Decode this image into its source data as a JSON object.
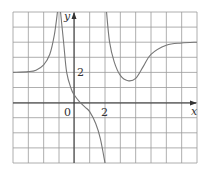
{
  "graph": {
    "axis_labels": {
      "x": "x",
      "y": "y"
    },
    "tick_labels": {
      "origin": "0",
      "x_two": "2",
      "y_two": "2"
    },
    "colors": {
      "grid": "#9a9a9a",
      "curve": "#777777",
      "axis": "#333333",
      "background": "#ffffff"
    }
  },
  "chart_data": {
    "type": "line",
    "title": "",
    "xlabel": "x",
    "ylabel": "y",
    "xlim": [
      -4,
      8
    ],
    "ylim": [
      -4,
      6
    ],
    "grid": true,
    "grid_step": 1,
    "annotations": [
      "0",
      "2 (x-axis)",
      "2 (y-axis)"
    ],
    "vertical_asymptotes": [
      -1,
      2
    ],
    "horizontal_asymptotes": {
      "left": 2,
      "right": 4
    },
    "series": [
      {
        "name": "left branch",
        "points": [
          [
            -4,
            2.0
          ],
          [
            -3,
            2.05
          ],
          [
            -2.5,
            2.15
          ],
          [
            -2,
            2.5
          ],
          [
            -1.6,
            3.2
          ],
          [
            -1.3,
            4.5
          ],
          [
            -1.1,
            6
          ]
        ]
      },
      {
        "name": "middle branch",
        "points": [
          [
            -0.9,
            6
          ],
          [
            -0.7,
            4
          ],
          [
            -0.5,
            2
          ],
          [
            -0.2,
            0.9
          ],
          [
            0,
            0.5
          ],
          [
            0.3,
            0.1
          ],
          [
            0.7,
            -0.3
          ],
          [
            1,
            -0.6
          ],
          [
            1.4,
            -1.4
          ],
          [
            1.7,
            -2.4
          ],
          [
            2.0,
            -4
          ]
        ]
      },
      {
        "name": "right branch",
        "points": [
          [
            2.1,
            6
          ],
          [
            2.3,
            4
          ],
          [
            2.6,
            2.7
          ],
          [
            3,
            1.8
          ],
          [
            3.5,
            1.45
          ],
          [
            4,
            1.6
          ],
          [
            4.5,
            2.4
          ],
          [
            5,
            3.2
          ],
          [
            6,
            3.8
          ],
          [
            7,
            3.95
          ],
          [
            8,
            4.0
          ]
        ]
      }
    ]
  }
}
